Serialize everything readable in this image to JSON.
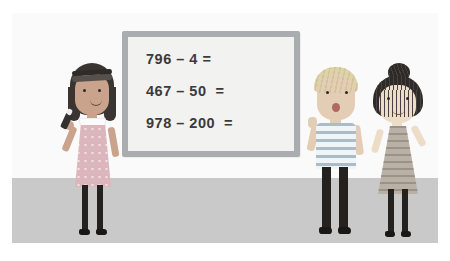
{
  "scene": {
    "title": "Classroom whiteboard subtraction lesson",
    "wall_color": "#fafafa",
    "floor_color": "#c9c9c9"
  },
  "whiteboard": {
    "frame_color": "#a9adb0",
    "face_color": "#f2f2f0",
    "equations": [
      "796 – 4 =",
      "467 – 50  =",
      "978 – 200  ="
    ]
  },
  "characters": [
    {
      "id": "girl-left",
      "label": "Girl with dark bob and headband holding a marker",
      "hair_color": "#3b3532",
      "skin_color": "#c9a38c",
      "outfit": "pink dotted pinafore dress",
      "outfit_color": "#dcb6bd",
      "holding": "marker"
    },
    {
      "id": "boy-middle",
      "label": "Boy with blond hair and striped t-shirt",
      "hair_color": "#ded2a8",
      "skin_color": "#e3cdb4",
      "outfit": "blue and white striped t-shirt",
      "outfit_color": "#9fb3bf",
      "holding": ""
    },
    {
      "id": "girl-right",
      "label": "Girl with hair in a bun wearing a chevron dress",
      "hair_color": "#2e2a28",
      "skin_color": "#eddcc6",
      "outfit": "grey chevron patterned dress",
      "outfit_color": "#b9b0a6",
      "holding": ""
    }
  ]
}
